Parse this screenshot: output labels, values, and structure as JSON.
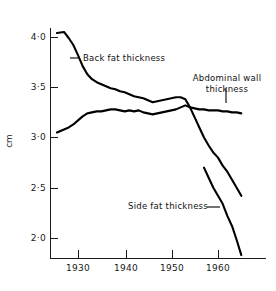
{
  "chart_data": {
    "type": "line",
    "title": "",
    "subtitle": "",
    "xlabel": "",
    "ylabel": "cm",
    "xlim": [
      1925,
      1966
    ],
    "ylim": [
      1.75,
      4.15
    ],
    "grid": false,
    "legend": "annotations on plot",
    "x_ticks": [
      1930,
      1940,
      1950,
      1960
    ],
    "x_tick_labels": [
      "1930",
      "1940",
      "1950",
      "1960"
    ],
    "y_ticks": [
      2.0,
      2.5,
      3.0,
      3.5,
      4.0
    ],
    "y_tick_labels": [
      "2·0",
      "2·5",
      "3·0",
      "3·5",
      "4·0"
    ],
    "series": [
      {
        "name": "Back fat thickness",
        "x": [
          1925.5,
          1927,
          1928,
          1929,
          1930,
          1931,
          1932,
          1933,
          1934,
          1935,
          1936,
          1937,
          1938,
          1939,
          1940,
          1941,
          1942,
          1943,
          1944,
          1945,
          1946,
          1947,
          1948,
          1949,
          1950,
          1951,
          1952,
          1953,
          1954,
          1955,
          1956,
          1957,
          1958,
          1959,
          1960,
          1961,
          1962,
          1963,
          1964,
          1965
        ],
        "values": [
          4.04,
          4.05,
          3.99,
          3.92,
          3.82,
          3.71,
          3.63,
          3.58,
          3.55,
          3.53,
          3.51,
          3.49,
          3.48,
          3.46,
          3.45,
          3.43,
          3.41,
          3.4,
          3.39,
          3.37,
          3.35,
          3.36,
          3.37,
          3.38,
          3.39,
          3.4,
          3.4,
          3.38,
          3.3,
          3.2,
          3.1,
          3.0,
          2.92,
          2.85,
          2.8,
          2.72,
          2.66,
          2.58,
          2.5,
          2.42
        ]
      },
      {
        "name": "Abdominal wall thickness",
        "x": [
          1925.5,
          1927,
          1928,
          1929,
          1930,
          1931,
          1932,
          1933,
          1934,
          1935,
          1936,
          1937,
          1938,
          1939,
          1940,
          1941,
          1942,
          1943,
          1944,
          1945,
          1946,
          1947,
          1948,
          1949,
          1950,
          1951,
          1952,
          1953,
          1954,
          1955,
          1956,
          1957,
          1958,
          1959,
          1960,
          1961,
          1962,
          1963,
          1964,
          1965
        ],
        "values": [
          3.05,
          3.08,
          3.1,
          3.13,
          3.17,
          3.21,
          3.24,
          3.25,
          3.26,
          3.26,
          3.27,
          3.28,
          3.28,
          3.27,
          3.26,
          3.27,
          3.26,
          3.27,
          3.25,
          3.24,
          3.23,
          3.24,
          3.25,
          3.26,
          3.27,
          3.28,
          3.3,
          3.32,
          3.3,
          3.29,
          3.28,
          3.28,
          3.27,
          3.27,
          3.27,
          3.26,
          3.26,
          3.25,
          3.25,
          3.24
        ]
      },
      {
        "name": "Side fat thickness",
        "x": [
          1957,
          1958,
          1959,
          1960,
          1961,
          1962,
          1963,
          1964,
          1965
        ],
        "values": [
          2.7,
          2.6,
          2.5,
          2.42,
          2.34,
          2.22,
          2.12,
          1.98,
          1.83
        ]
      }
    ],
    "annotations": [
      {
        "label": "Back fat thickness",
        "lines": [
          "Back fat thickness"
        ]
      },
      {
        "label": "Abdominal wall thickness",
        "lines": [
          "Abdominal wall",
          "thickness"
        ]
      },
      {
        "label": "Side fat thickness",
        "lines": [
          "Side fat thickness"
        ]
      }
    ],
    "colors": {
      "line": "#000000",
      "axis": "#1a1a1a",
      "background": "#ffffff"
    }
  },
  "axis": {
    "y_title": "cm",
    "y_labels": {
      "t40": "4·0",
      "t35": "3·5",
      "t30": "3·0",
      "t25": "2·5",
      "t20": "2·0"
    },
    "x_labels": {
      "t1930": "1930",
      "t1940": "1940",
      "t1950": "1950",
      "t1960": "1960"
    }
  },
  "annotations": {
    "back_fat": "Back fat thickness",
    "abdominal_wall_line1": "Abdominal wall",
    "abdominal_wall_line2": "thickness",
    "side_fat": "Side fat thickness"
  }
}
